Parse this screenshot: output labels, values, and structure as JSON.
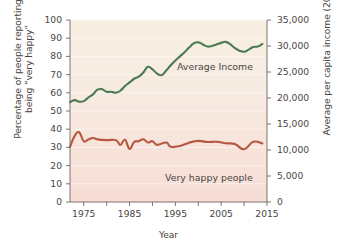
{
  "chart_data": {
    "type": "line",
    "title": "",
    "xlabel": "Year",
    "ylabel_left": "Percentage of people reporting\nbeing “very happy”",
    "ylabel_right": "Average per capita income (2015 dollars)",
    "xlim": [
      1972,
      2015
    ],
    "ylim_left": [
      0,
      100
    ],
    "ylim_right": [
      0,
      35000
    ],
    "xticks": [
      1975,
      1980,
      1985,
      1990,
      1995,
      2000,
      2005,
      2010,
      2015
    ],
    "xticklabels": [
      "1975",
      "",
      "1985",
      "",
      "1995",
      "",
      "2005",
      "",
      "2015"
    ],
    "yticks_left": [
      0,
      10,
      20,
      30,
      40,
      50,
      60,
      70,
      80,
      90,
      100
    ],
    "yticklabels_left": [
      "0",
      "10",
      "20",
      "30",
      "40",
      "50",
      "60",
      "70",
      "80",
      "90",
      "100"
    ],
    "yticks_right": [
      0,
      5000,
      10000,
      15000,
      20000,
      25000,
      30000,
      35000
    ],
    "yticklabels_right": [
      "0",
      "5,000",
      "10,000",
      "15,000",
      "20,000",
      "25,000",
      "30,000",
      "35,000"
    ],
    "grid": true,
    "legend_position": "inline-annotations",
    "background_gradient": [
      "#f7efe2",
      "#f6ddd6"
    ],
    "series": [
      {
        "name": "Average Income",
        "axis": "right",
        "color": "#4a7a52",
        "annotation": "Average Income",
        "x": [
          1972,
          1973,
          1974,
          1975,
          1976,
          1977,
          1978,
          1979,
          1980,
          1981,
          1982,
          1983,
          1984,
          1985,
          1986,
          1987,
          1988,
          1989,
          1990,
          1991,
          1992,
          1993,
          1994,
          1995,
          1996,
          1997,
          1998,
          1999,
          2000,
          2001,
          2002,
          2003,
          2004,
          2005,
          2006,
          2007,
          2008,
          2009,
          2010,
          2011,
          2012,
          2013,
          2014
        ],
        "values": [
          19200,
          19600,
          19300,
          19400,
          20100,
          20700,
          21600,
          21700,
          21200,
          21200,
          21000,
          21400,
          22300,
          23000,
          23700,
          24100,
          24900,
          26000,
          25500,
          24700,
          24400,
          25300,
          26300,
          27200,
          28000,
          28800,
          29700,
          30500,
          30700,
          30300,
          29900,
          30000,
          30300,
          30600,
          30800,
          30300,
          29600,
          29100,
          28900,
          29300,
          29800,
          29900,
          30400
        ]
      },
      {
        "name": "Very happy people",
        "axis": "left",
        "color": "#b65742",
        "annotation": "Very happy people",
        "x": [
          1972,
          1973,
          1974,
          1975,
          1976,
          1977,
          1978,
          1980,
          1982,
          1983,
          1984,
          1985,
          1986,
          1987,
          1988,
          1989,
          1990,
          1991,
          1993,
          1994,
          1996,
          1998,
          2000,
          2002,
          2004,
          2006,
          2008,
          2010,
          2012,
          2014
        ],
        "values": [
          30.3,
          36.2,
          38.3,
          33.4,
          34.3,
          35.2,
          34.4,
          34.0,
          34.0,
          31.4,
          34.2,
          29.2,
          33.0,
          33.4,
          34.5,
          32.7,
          33.4,
          31.4,
          32.7,
          30.3,
          30.8,
          32.6,
          33.6,
          33.0,
          33.1,
          32.3,
          31.8,
          29.0,
          33.1,
          32.2
        ]
      }
    ]
  }
}
